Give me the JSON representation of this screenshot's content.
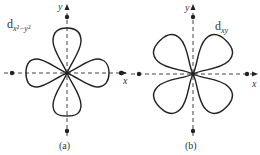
{
  "figures": [
    {
      "id": "a",
      "orbital_label": "d",
      "orbital_subscript": "x²−y²",
      "x_axis_label": "x",
      "y_axis_label": "y",
      "caption": "(a)",
      "lobe_orientation": "along axes"
    },
    {
      "id": "b",
      "orbital_label": "d",
      "orbital_subscript": "xy",
      "x_axis_label": "x",
      "y_axis_label": "y",
      "caption": "(b)",
      "lobe_orientation": "between axes"
    }
  ],
  "colors": {
    "line": "#222222",
    "axis": "#444444",
    "background": "#ffffff"
  }
}
